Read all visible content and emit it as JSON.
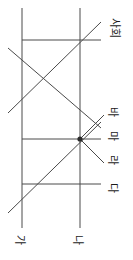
{
  "figure": {
    "type": "line-diagram",
    "orientation_note": "rotated-90-degrees",
    "background_color": "#ffffff",
    "line_color": "#4a4a4a",
    "text_color": "#1a1a1a",
    "labels": [
      {
        "id": "label-sahoe",
        "text": "사회",
        "x": 112,
        "y": 28,
        "rotation": 90
      },
      {
        "id": "label-ba",
        "text": "바",
        "x": 112,
        "y": 112,
        "rotation": 90
      },
      {
        "id": "label-ma",
        "text": "마",
        "x": 112,
        "y": 136,
        "rotation": 90
      },
      {
        "id": "label-ra",
        "text": "라",
        "x": 112,
        "y": 160,
        "rotation": 90
      },
      {
        "id": "label-da",
        "text": "다",
        "x": 112,
        "y": 188,
        "rotation": 90
      },
      {
        "id": "label-ga",
        "text": "가",
        "x": 20,
        "y": 240,
        "rotation": 90
      },
      {
        "id": "label-na",
        "text": "나",
        "x": 78,
        "y": 240,
        "rotation": 90
      }
    ],
    "vertical_lines": [
      {
        "id": "vertical-line-ga",
        "x": 22,
        "y1": 8,
        "y2": 228
      },
      {
        "id": "vertical-line-na",
        "x": 80,
        "y1": 8,
        "y2": 228
      }
    ],
    "horizontal_lines": [
      {
        "id": "horizontal-line-sahoe",
        "y": 40,
        "x1": 22,
        "x2": 101
      },
      {
        "id": "horizontal-line-ma",
        "y": 139,
        "x1": 22,
        "x2": 101
      },
      {
        "id": "horizontal-line-da",
        "y": 184,
        "x1": 22,
        "x2": 101
      }
    ],
    "diagonal_lines": [
      {
        "id": "diagonal-upper-descending",
        "x1": 8,
        "y1": 48,
        "x2": 101,
        "y2": 128
      },
      {
        "id": "diagonal-upper-ascending",
        "x1": 8,
        "y1": 113,
        "x2": 101,
        "y2": 22
      },
      {
        "id": "diagonal-lower-ascending",
        "x1": 8,
        "y1": 213,
        "x2": 101,
        "y2": 122
      },
      {
        "id": "diagonal-node-ba",
        "x1": 80,
        "y1": 139,
        "x2": 104,
        "y2": 115
      },
      {
        "id": "diagonal-node-ra",
        "x1": 80,
        "y1": 139,
        "x2": 104,
        "y2": 163
      }
    ],
    "nodes": [
      {
        "id": "node-junction-ma",
        "x": 80,
        "y": 139,
        "radius": 2.6
      }
    ]
  }
}
